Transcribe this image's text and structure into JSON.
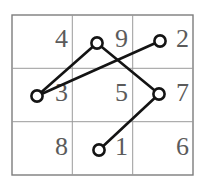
{
  "figure": {
    "background_color": "#ffffff",
    "width": 204,
    "height": 188
  },
  "grid": {
    "rows": 3,
    "cols": 3,
    "x0": 12,
    "y0": 15,
    "x1": 193,
    "y1": 175,
    "line_color": "#9a9a9a",
    "border_color": "#7d7d7d",
    "label_color": "#5b5b5b",
    "cells": [
      {
        "id": "cell-r0c0",
        "label": "4",
        "row": 0,
        "col": 0,
        "tx": 68,
        "ty": 47
      },
      {
        "id": "cell-r0c1",
        "label": "9",
        "row": 0,
        "col": 1,
        "tx": 128,
        "ty": 47
      },
      {
        "id": "cell-r0c2",
        "label": "2",
        "row": 0,
        "col": 2,
        "tx": 189,
        "ty": 47
      },
      {
        "id": "cell-r1c0",
        "label": "3",
        "row": 1,
        "col": 0,
        "tx": 68,
        "ty": 101
      },
      {
        "id": "cell-r1c1",
        "label": "5",
        "row": 1,
        "col": 1,
        "tx": 128,
        "ty": 101
      },
      {
        "id": "cell-r1c2",
        "label": "7",
        "row": 1,
        "col": 2,
        "tx": 189,
        "ty": 101
      },
      {
        "id": "cell-r2c0",
        "label": "8",
        "row": 2,
        "col": 0,
        "tx": 68,
        "ty": 155
      },
      {
        "id": "cell-r2c1",
        "label": "1",
        "row": 2,
        "col": 1,
        "tx": 128,
        "ty": 155
      },
      {
        "id": "cell-r2c2",
        "label": "6",
        "row": 2,
        "col": 2,
        "tx": 189,
        "ty": 155
      }
    ],
    "inner_vertical_x": [
      72.3,
      132.7
    ],
    "inner_horizontal_y": [
      68.3,
      121.7
    ]
  },
  "graph": {
    "node_color": "#ffffff",
    "node_stroke": "#141414",
    "edge_color": "#141414",
    "node_radius": 5.6,
    "nodes": [
      {
        "id": "node-left",
        "cx": 37,
        "cy": 96
      },
      {
        "id": "node-top-mid",
        "cx": 97,
        "cy": 43
      },
      {
        "id": "node-top-right",
        "cx": 160,
        "cy": 41
      },
      {
        "id": "node-right-mid",
        "cx": 159,
        "cy": 94
      },
      {
        "id": "node-bottom",
        "cx": 99,
        "cy": 150
      }
    ],
    "edges": [
      {
        "id": "edge-left-topmid",
        "from": "node-left",
        "to": "node-top-mid",
        "x1": 37,
        "y1": 96,
        "x2": 97,
        "y2": 43
      },
      {
        "id": "edge-topmid-rightmid",
        "from": "node-top-mid",
        "to": "node-right-mid",
        "x1": 97,
        "y1": 43,
        "x2": 159,
        "y2": 94
      },
      {
        "id": "edge-rightmid-bottom",
        "from": "node-right-mid",
        "to": "node-bottom",
        "x1": 159,
        "y1": 94,
        "x2": 99,
        "y2": 150
      },
      {
        "id": "edge-left-topright",
        "from": "node-left",
        "to": "node-top-right",
        "x1": 37,
        "y1": 96,
        "x2": 160,
        "y2": 41
      }
    ]
  },
  "chart_data": {
    "type": "diagram",
    "grid_values": [
      [
        "4",
        "9",
        "2"
      ],
      [
        "3",
        "5",
        "7"
      ],
      [
        "8",
        "1",
        "6"
      ]
    ],
    "node_points": [
      {
        "name": "node-left",
        "x": 37,
        "y": 96
      },
      {
        "name": "node-top-mid",
        "x": 97,
        "y": 43
      },
      {
        "name": "node-top-right",
        "x": 160,
        "y": 41
      },
      {
        "name": "node-right-mid",
        "x": 159,
        "y": 94
      },
      {
        "name": "node-bottom",
        "x": 99,
        "y": 150
      }
    ],
    "edge_pairs": [
      [
        "node-left",
        "node-top-mid"
      ],
      [
        "node-top-mid",
        "node-right-mid"
      ],
      [
        "node-right-mid",
        "node-bottom"
      ],
      [
        "node-left",
        "node-top-right"
      ]
    ]
  }
}
